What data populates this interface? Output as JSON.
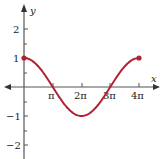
{
  "chart_data": {
    "type": "line",
    "title": "",
    "function": "y = cos(x/2)",
    "xlabel": "x",
    "ylabel": "y",
    "xlim": [
      -1.5,
      4.6
    ],
    "ylim": [
      -2.5,
      2.6
    ],
    "x_ticks": [
      "π",
      "2π",
      "3π",
      "4π"
    ],
    "x_tick_values": [
      3.1416,
      6.2832,
      9.4248,
      12.5664
    ],
    "y_ticks": [
      "2",
      "1",
      "-1",
      "-2"
    ],
    "y_tick_values": [
      2,
      1,
      -1,
      -2
    ],
    "grid": false,
    "series": [
      {
        "name": "cos(x/2)",
        "color": "#b22234",
        "x": [
          0,
          1.5708,
          3.1416,
          4.7124,
          6.2832,
          7.854,
          9.4248,
          10.9956,
          12.5664
        ],
        "y": [
          1,
          0.7071,
          0,
          -0.7071,
          -1,
          -0.7071,
          0,
          0.7071,
          1
        ],
        "endpoints_marked": true
      }
    ]
  },
  "labels": {
    "x_axis": "x",
    "y_axis": "y",
    "xt1": "π",
    "xt2": "2π",
    "xt3": "3π",
    "xt4": "4π",
    "yt2": "2",
    "yt1": "1",
    "ytm1": "−1",
    "ytm2": "−2"
  }
}
